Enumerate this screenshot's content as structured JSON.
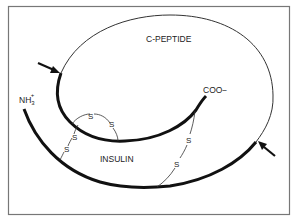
{
  "diagram": {
    "labels": {
      "c_peptide": "C-PEPTIDE",
      "insulin": "INSULIN",
      "n_terminus": "NH",
      "n_terminus_sub": "3",
      "n_terminus_sup": "+",
      "c_terminus": "COO−"
    },
    "disulfide_symbol": "S",
    "colors": {
      "line": "#111111",
      "thin_line": "#333333",
      "border": "#777777",
      "background": "#ffffff"
    }
  }
}
